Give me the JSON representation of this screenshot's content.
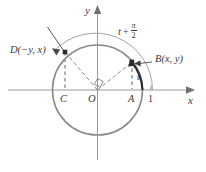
{
  "figure": {
    "name": "unit-circle-rotation-diagram",
    "colors": {
      "axis": "#9a9a9a",
      "circle": "#8c8c8c",
      "arc_outer": "#9a9a9a",
      "arc_angle_t": "#2b2b2b",
      "dashed": "#8f8f8f",
      "radius": "#6f6f6f",
      "text": "#3b3b3b",
      "point_fill": "#2b2b2b",
      "background": "#ffffff"
    },
    "geometry": {
      "center": {
        "x": 97.5,
        "y": 90
      },
      "radius": 45,
      "outer_arc_radius": 57,
      "point_B": {
        "x": 132,
        "y": 62
      },
      "point_D": {
        "x": 65,
        "y": 52
      },
      "point_A": {
        "x": 132,
        "y": 90
      },
      "point_C": {
        "x": 65,
        "y": 90
      },
      "tick_one": {
        "x": 151,
        "y": 90
      }
    }
  },
  "axes": {
    "x_label": "x",
    "y_label": "y",
    "tick_one_label": "1"
  },
  "points": {
    "origin_label": "O",
    "foot_left_label": "C",
    "foot_right_label": "A",
    "terminal_right_label": "B(x, y)",
    "terminal_left_label": "D(−y, x)"
  },
  "angles": {
    "t_label": "t",
    "rotated_label": {
      "variable": "t",
      "operator": "+",
      "fraction_numerator": "π",
      "fraction_denominator": "2"
    }
  },
  "markers": {
    "right_angle": "right-angle-square"
  }
}
